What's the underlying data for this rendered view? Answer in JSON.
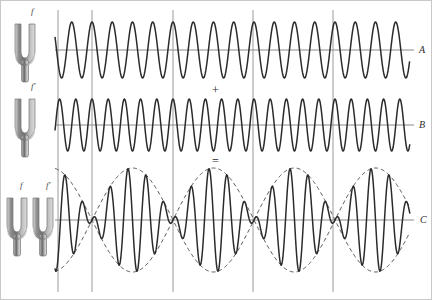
{
  "figure": {
    "background_color": "#ffffff",
    "wave_color": "#2b2b2b",
    "envelope_color": "#555555",
    "axis_color": "#8a8a8a",
    "grid_color": "#9a9a9a",
    "fork_color": "#8d8d8d"
  },
  "operators": {
    "plus": "+",
    "equals": "="
  },
  "forks": [
    {
      "id": "fork-a",
      "label": "f",
      "x": 14,
      "y": 22,
      "label_x": 31,
      "label_y": 8
    },
    {
      "id": "fork-b",
      "label": "f′",
      "x": 14,
      "y": 97,
      "label_x": 31,
      "label_y": 83
    },
    {
      "id": "fork-c1",
      "label": "f",
      "x": 6,
      "y": 196,
      "label_x": 20,
      "label_y": 182
    },
    {
      "id": "fork-c2",
      "label": "f′",
      "x": 32,
      "y": 196,
      "label_x": 47,
      "label_y": 182
    }
  ],
  "panels": [
    {
      "id": "panel-a",
      "side_label": "A",
      "side_label_x": 418,
      "side_label_y": 45,
      "baseline_y": 50,
      "amplitude": 28,
      "cycles_per_segment": 4,
      "has_envelope": false
    },
    {
      "id": "panel-b",
      "side_label": "B",
      "side_label_x": 418,
      "side_label_y": 120,
      "baseline_y": 125,
      "amplitude": 26,
      "cycles_per_segment": 5,
      "has_envelope": false
    },
    {
      "id": "panel-c",
      "side_label": "C",
      "side_label_x": 418,
      "side_label_y": 215,
      "baseline_y": 220,
      "amplitude": 52,
      "cycles_per_segment": 4.5,
      "has_envelope": true
    }
  ],
  "chart_data": {
    "type": "line",
    "xlabel": "",
    "ylabel": "",
    "grid": true,
    "legend_position": "right",
    "x_range": [
      55,
      410
    ],
    "gridlines_x": [
      58,
      92,
      173,
      253,
      333
    ],
    "series": [
      {
        "name": "A",
        "description": "Wave from tuning fork of frequency f",
        "frequency_label": "f",
        "relative_frequency": 4,
        "amplitude": 1.0,
        "baseline_y": 50,
        "pixel_amplitude": 28,
        "waveform": "sine",
        "phase_deg": 90,
        "cycles_across_plot": 17.5
      },
      {
        "name": "B",
        "description": "Wave from tuning fork of frequency f prime",
        "frequency_label": "f′",
        "relative_frequency": 5,
        "amplitude": 1.0,
        "baseline_y": 125,
        "pixel_amplitude": 26,
        "waveform": "sine",
        "phase_deg": 90,
        "cycles_across_plot": 22.0
      },
      {
        "name": "C",
        "description": "Superposition A + B showing beats",
        "frequency_label": "f and f′ together",
        "amplitude": 2.0,
        "baseline_y": 220,
        "pixel_amplitude": 52,
        "waveform": "sum-of-sines",
        "beats_across_plot": 4,
        "beat_node_x": [
          92,
          173,
          253,
          333
        ],
        "envelope": "dashed cosine envelope, period equal to one beat"
      }
    ],
    "annotations": [
      {
        "text": "+",
        "x": 215,
        "y": 90
      },
      {
        "text": "=",
        "x": 215,
        "y": 162
      },
      {
        "text": "A",
        "x": 418,
        "y": 45
      },
      {
        "text": "B",
        "x": 418,
        "y": 120
      },
      {
        "text": "C",
        "x": 418,
        "y": 215
      },
      {
        "text": "f",
        "x": 31,
        "y": 8
      },
      {
        "text": "f′",
        "x": 31,
        "y": 83
      },
      {
        "text": "f",
        "x": 20,
        "y": 182
      },
      {
        "text": "f′",
        "x": 47,
        "y": 182
      }
    ]
  }
}
